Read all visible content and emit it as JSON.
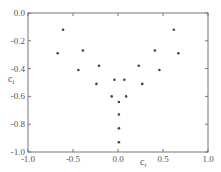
{
  "chart_data": {
    "type": "scatter",
    "title": "",
    "xlabel": "c",
    "xlabel_sub": "r",
    "ylabel": "c",
    "ylabel_sub": "i",
    "xlim": [
      -1.0,
      1.0
    ],
    "ylim": [
      -1.0,
      0.0
    ],
    "xticks": [
      -1.0,
      -0.5,
      0.0,
      0.5,
      1.0
    ],
    "xtick_labels": [
      "-1.0",
      "-0.5",
      "0.0",
      "0.5",
      "1.0"
    ],
    "yticks": [
      0.0,
      -0.2,
      -0.4,
      -0.6,
      -0.8,
      -1.0
    ],
    "ytick_labels": [
      "0.0",
      "-0.2",
      "-0.4",
      "-0.6",
      "-0.8",
      "-1.0"
    ],
    "grid": false,
    "legend": "none",
    "marker_color": "#444444",
    "series": [
      {
        "name": "eigenvalues",
        "points": [
          {
            "x": -0.61,
            "y": -0.12
          },
          {
            "x": 0.62,
            "y": -0.12
          },
          {
            "x": -0.67,
            "y": -0.29
          },
          {
            "x": 0.67,
            "y": -0.29
          },
          {
            "x": -0.39,
            "y": -0.27
          },
          {
            "x": 0.41,
            "y": -0.27
          },
          {
            "x": -0.44,
            "y": -0.41
          },
          {
            "x": 0.46,
            "y": -0.41
          },
          {
            "x": -0.21,
            "y": -0.38
          },
          {
            "x": 0.23,
            "y": -0.38
          },
          {
            "x": -0.24,
            "y": -0.51
          },
          {
            "x": 0.27,
            "y": -0.51
          },
          {
            "x": -0.04,
            "y": -0.48
          },
          {
            "x": 0.07,
            "y": -0.48
          },
          {
            "x": -0.07,
            "y": -0.6
          },
          {
            "x": 0.09,
            "y": -0.6
          },
          {
            "x": 0.01,
            "y": -0.64
          },
          {
            "x": 0.01,
            "y": -0.73
          },
          {
            "x": 0.01,
            "y": -0.83
          },
          {
            "x": 0.01,
            "y": -0.93
          }
        ]
      }
    ]
  }
}
